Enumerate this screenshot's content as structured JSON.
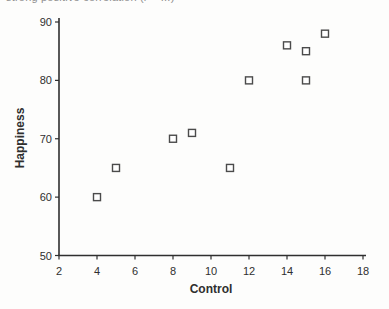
{
  "figure": {
    "caption_fragment": "strong positive correlation (r = ...)"
  },
  "colors": {
    "ink": "#2f2f2f",
    "marker_stroke": "#4b4b4b",
    "marker_fill": "#ffffff",
    "background": "#fdfdfc",
    "caption_text": "#8e8e8e"
  },
  "chart_data": {
    "type": "scatter",
    "title": "",
    "caption_fragment": "strong positive correlation (r = ...)",
    "xlabel": "Control",
    "ylabel": "Happiness",
    "xlim": [
      2,
      18
    ],
    "ylim": [
      50,
      90
    ],
    "xticks": [
      2,
      4,
      6,
      8,
      10,
      12,
      14,
      16,
      18
    ],
    "yticks": [
      50,
      60,
      70,
      80,
      90
    ],
    "grid": false,
    "legend": "none",
    "marker": "open-square",
    "points": [
      {
        "control": 4,
        "happiness": 60
      },
      {
        "control": 5,
        "happiness": 65
      },
      {
        "control": 8,
        "happiness": 70
      },
      {
        "control": 9,
        "happiness": 71
      },
      {
        "control": 11,
        "happiness": 65
      },
      {
        "control": 12,
        "happiness": 80
      },
      {
        "control": 14,
        "happiness": 86
      },
      {
        "control": 15,
        "happiness": 85
      },
      {
        "control": 15,
        "happiness": 80
      },
      {
        "control": 16,
        "happiness": 88
      }
    ]
  }
}
